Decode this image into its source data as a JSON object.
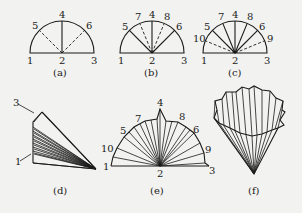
{
  "figure": {
    "panels": [
      {
        "id": "a",
        "caption": "(a)",
        "labels": {
          "p1": "1",
          "p2": "2",
          "p3": "3",
          "p4": "4",
          "p5": "5",
          "p6": "6"
        }
      },
      {
        "id": "b",
        "caption": "(b)",
        "labels": {
          "p1": "1",
          "p2": "2",
          "p3": "3",
          "p4": "4",
          "p5": "5",
          "p6": "6",
          "p7": "7",
          "p8": "8"
        }
      },
      {
        "id": "c",
        "caption": "(c)",
        "labels": {
          "p1": "1",
          "p2": "2",
          "p3": "3",
          "p4": "4",
          "p5": "5",
          "p6": "6",
          "p7": "7",
          "p8": "8",
          "p9": "9",
          "p10": "10"
        }
      },
      {
        "id": "d",
        "caption": "(d)",
        "labels": {
          "p1": "1",
          "p3": "3"
        }
      },
      {
        "id": "e",
        "caption": "(e)",
        "labels": {
          "p1": "1",
          "p2": "2",
          "p3": "3",
          "p4": "4",
          "p5": "5",
          "p6": "6",
          "p7": "7",
          "p8": "8",
          "p9": "9",
          "p10": "10"
        }
      },
      {
        "id": "f",
        "caption": "(f)",
        "labels": {}
      }
    ]
  }
}
